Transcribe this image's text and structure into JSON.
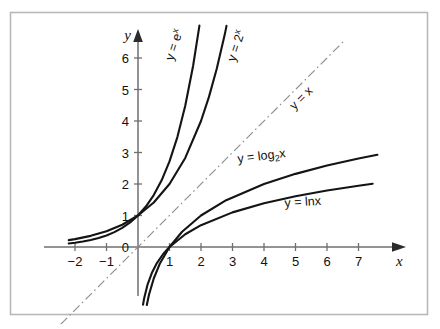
{
  "chart_data": {
    "type": "line",
    "title": "",
    "xlabel": "x",
    "ylabel": "y",
    "xlim": [
      -2.6,
      8.2
    ],
    "ylim": [
      -2.6,
      7.2
    ],
    "grid": false,
    "legend": "inline-curve-labels",
    "xticks": [
      -2,
      -1,
      1,
      2,
      3,
      4,
      5,
      6,
      7
    ],
    "xtick_labels": [
      "−2",
      "−1",
      "1",
      "2",
      "3",
      "4",
      "5",
      "6",
      "7"
    ],
    "yticks": [
      0,
      1,
      2,
      3,
      4,
      5,
      6
    ],
    "ytick_labels": [
      "0",
      "1",
      "2",
      "3",
      "4",
      "5",
      "6"
    ],
    "origin_label": "0",
    "series": [
      {
        "name": "y = e^x",
        "label_text": "y = e",
        "label_sup": "x",
        "style": "solid",
        "color": "#111111",
        "x": [
          -2.2,
          -2.0,
          -1.75,
          -1.5,
          -1.25,
          -1.0,
          -0.75,
          -0.5,
          -0.25,
          0,
          0.25,
          0.5,
          0.75,
          1.0,
          1.25,
          1.5,
          1.75,
          1.95
        ],
        "y": [
          0.111,
          0.135,
          0.174,
          0.223,
          0.287,
          0.368,
          0.472,
          0.607,
          0.779,
          1.0,
          1.284,
          1.649,
          2.117,
          2.718,
          3.49,
          4.482,
          5.755,
          7.03
        ]
      },
      {
        "name": "y = 2^x",
        "label_text": "y = 2",
        "label_sup": "x",
        "style": "solid",
        "color": "#111111",
        "x": [
          -2.2,
          -2.0,
          -1.5,
          -1.0,
          -0.5,
          0,
          0.5,
          1.0,
          1.5,
          2.0,
          2.25,
          2.5,
          2.75,
          2.81
        ],
        "y": [
          0.218,
          0.25,
          0.354,
          0.5,
          0.707,
          1.0,
          1.414,
          2.0,
          2.828,
          4.0,
          4.757,
          5.657,
          6.727,
          7.02
        ]
      },
      {
        "name": "y = x",
        "label_text": "y = x",
        "style": "dash-dot",
        "color": "#8a8a8a",
        "x": [
          -2.45,
          6.55
        ],
        "y": [
          -2.45,
          6.55
        ]
      },
      {
        "name": "y = log2 x",
        "label_text": "y = log",
        "label_sub": "2",
        "label_tail": "x",
        "style": "solid",
        "color": "#111111",
        "x": [
          0.28,
          0.35,
          0.5,
          0.7,
          1.0,
          1.4,
          2.0,
          2.8,
          4.0,
          5.0,
          6.0,
          7.0,
          7.6
        ],
        "y": [
          -1.84,
          -1.51,
          -1.0,
          -0.515,
          0.0,
          0.485,
          1.0,
          1.485,
          2.0,
          2.322,
          2.585,
          2.807,
          2.926
        ]
      },
      {
        "name": "y = ln x",
        "label_text": "y = lnx",
        "style": "solid",
        "color": "#111111",
        "x": [
          0.16,
          0.2,
          0.3,
          0.45,
          0.6,
          0.8,
          1.0,
          1.5,
          2.0,
          3.0,
          4.0,
          5.0,
          6.0,
          7.0,
          7.45
        ],
        "y": [
          -1.83,
          -1.609,
          -1.204,
          -0.799,
          -0.511,
          -0.223,
          0.0,
          0.405,
          0.693,
          1.099,
          1.386,
          1.609,
          1.792,
          1.946,
          2.008
        ]
      }
    ]
  },
  "axes": {
    "x_axis_name": "x",
    "y_axis_name": "y"
  }
}
